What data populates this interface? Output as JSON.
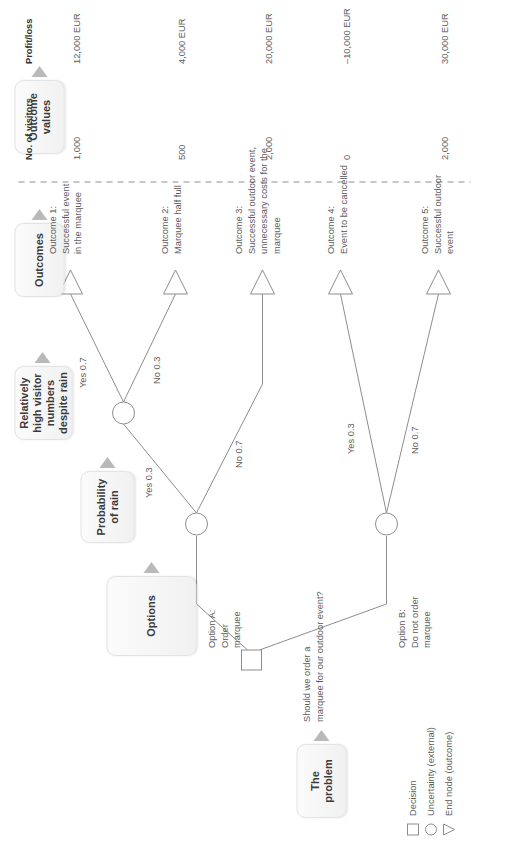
{
  "diagram": {
    "stages": [
      {
        "id": "problem",
        "label": "The\nproblem"
      },
      {
        "id": "options",
        "label": "Options"
      },
      {
        "id": "probability",
        "label": "Probability\nof rain"
      },
      {
        "id": "visitors",
        "label": "Relatively\nhigh visitor\nnumbers\ndespite rain"
      },
      {
        "id": "outcomes",
        "label": "Outcomes"
      },
      {
        "id": "values",
        "label": "Outcome\nvalues"
      }
    ],
    "problem_statement": "Should we order a\nmarquee for our outdoor event?",
    "options": [
      {
        "id": "a",
        "label": "Option A:\nOrder\nmarquee"
      },
      {
        "id": "b",
        "label": "Option B:\nDo not order\nmarquee"
      }
    ],
    "branch_labels": {
      "a_rain_yes": "Yes 0.3",
      "a_rain_no": "No 0.7",
      "a_visitors_yes": "Yes 0.7",
      "a_visitors_no": "No 0.3",
      "b_rain_yes": "Yes 0.3",
      "b_rain_no": "No 0.7"
    },
    "outcomes": [
      {
        "n": 1,
        "text": "Outcome 1:\nSuccessful event\nin the marquee",
        "visitors": "1,000",
        "profit": "12,000 EUR"
      },
      {
        "n": 2,
        "text": "Outcome 2:\nMarquee half full",
        "visitors": "500",
        "profit": "4,000 EUR"
      },
      {
        "n": 3,
        "text": "Outcome 3:\nSuccessful outdoor event,\nunnecessary costs for the\nmarquee",
        "visitors": "2,000",
        "profit": "20,000 EUR"
      },
      {
        "n": 4,
        "text": "Outcome 4:\nEvent to be cancelled",
        "visitors": "0",
        "profit": "–10,000 EUR"
      },
      {
        "n": 5,
        "text": "Outcome 5:\nSuccessful outdoor\nevent",
        "visitors": "2,000",
        "profit": "30,000 EUR"
      }
    ],
    "value_headers": {
      "visitors": "No. of visitors",
      "profit": "Profit/loss"
    },
    "legend": [
      {
        "shape": "square",
        "label": "Decision"
      },
      {
        "shape": "circle",
        "label": "Uncertainty (external)"
      },
      {
        "shape": "triangle",
        "label": "End node (outcome)"
      }
    ],
    "colors": {
      "line": "#8d8d8d",
      "chip_border": "#e3e3e3",
      "arrow": "#b9b9b9",
      "text": "#5b5b5b",
      "divider": "#b5b5b5"
    }
  }
}
